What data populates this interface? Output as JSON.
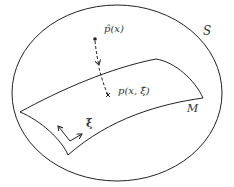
{
  "diagram": {
    "labels": {
      "space": "S",
      "manifold": "M",
      "projected_point": "p̂(x)",
      "model_point": "p(x, ξ̂)",
      "coordinates": "ξ"
    },
    "colors": {
      "stroke": "#222222",
      "text": "#333333",
      "background": "#ffffff"
    },
    "elements": [
      {
        "type": "ellipse",
        "name": "S",
        "description": "ambient space"
      },
      {
        "type": "surface",
        "name": "M",
        "description": "curved sheet (manifold)"
      },
      {
        "type": "point",
        "name": "p̂(x)",
        "marker": "dot"
      },
      {
        "type": "point",
        "name": "p(x, ξ̂)",
        "marker": "cross"
      },
      {
        "type": "dashed-arrow",
        "from": "p̂(x)",
        "to": "p(x, ξ̂)"
      },
      {
        "type": "coordinate-axes",
        "name": "ξ"
      }
    ]
  }
}
